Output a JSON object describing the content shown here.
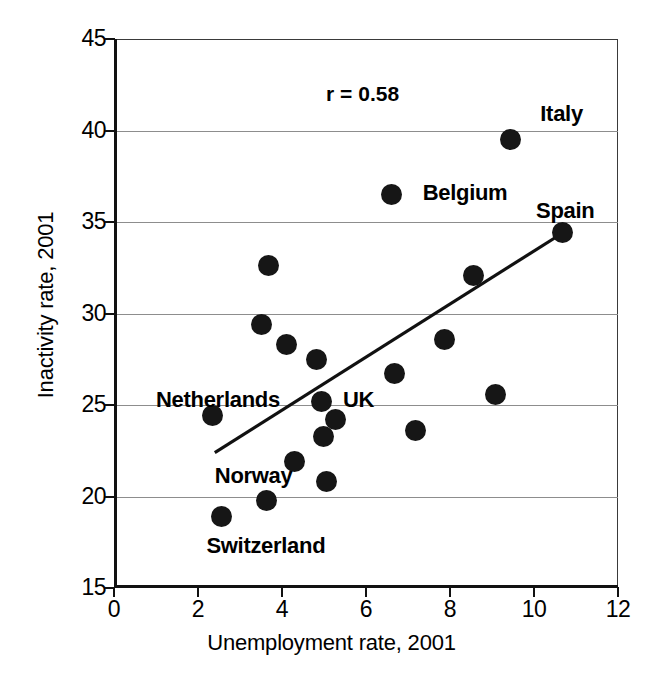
{
  "chart_data": {
    "type": "scatter",
    "title": "",
    "xlabel": "Unemployment rate, 2001",
    "ylabel": "Inactivity rate, 2001",
    "xlim": [
      0,
      12
    ],
    "ylim": [
      15,
      45
    ],
    "xticks": [
      0,
      2,
      4,
      6,
      8,
      10,
      12
    ],
    "yticks": [
      15,
      20,
      25,
      30,
      35,
      40,
      45
    ],
    "grid": "horizontal",
    "legend": "none",
    "annotations": [
      {
        "name": "correlation",
        "text": "r = 0.58",
        "x": 5.05,
        "y": 42.0
      }
    ],
    "point_labels": [
      {
        "name": "Italy",
        "text": "Italy",
        "x": 10.15,
        "y": 40.9
      },
      {
        "name": "Belgium",
        "text": "Belgium",
        "x": 7.35,
        "y": 36.6
      },
      {
        "name": "Spain",
        "text": "Spain",
        "x": 10.05,
        "y": 35.6
      },
      {
        "name": "Netherlands",
        "text": "Netherlands",
        "x": 1.0,
        "y": 25.3
      },
      {
        "name": "UK",
        "text": "UK",
        "x": 5.45,
        "y": 25.3
      },
      {
        "name": "Norway",
        "text": "Norway",
        "x": 2.4,
        "y": 21.1
      },
      {
        "name": "Switzerland",
        "text": "Switzerland",
        "x": 2.2,
        "y": 17.3
      }
    ],
    "points": [
      {
        "label": "Switzerland",
        "x": 2.55,
        "y": 18.9
      },
      {
        "label": "Netherlands",
        "x": 2.35,
        "y": 24.4
      },
      {
        "label": "",
        "x": 3.5,
        "y": 29.4
      },
      {
        "label": "Norway",
        "x": 3.62,
        "y": 19.8
      },
      {
        "label": "",
        "x": 3.68,
        "y": 32.6
      },
      {
        "label": "",
        "x": 4.1,
        "y": 28.3
      },
      {
        "label": "",
        "x": 4.3,
        "y": 21.9
      },
      {
        "label": "",
        "x": 4.82,
        "y": 27.5
      },
      {
        "label": "UK",
        "x": 4.95,
        "y": 25.2
      },
      {
        "label": "",
        "x": 4.98,
        "y": 23.3
      },
      {
        "label": "",
        "x": 5.05,
        "y": 20.8
      },
      {
        "label": "",
        "x": 5.28,
        "y": 24.2
      },
      {
        "label": "Belgium",
        "x": 6.6,
        "y": 36.5
      },
      {
        "label": "",
        "x": 6.68,
        "y": 26.7
      },
      {
        "label": "",
        "x": 7.18,
        "y": 23.6
      },
      {
        "label": "",
        "x": 7.88,
        "y": 28.6
      },
      {
        "label": "",
        "x": 8.55,
        "y": 32.1
      },
      {
        "label": "",
        "x": 9.08,
        "y": 25.6
      },
      {
        "label": "Italy",
        "x": 9.45,
        "y": 39.5
      },
      {
        "label": "Spain",
        "x": 10.68,
        "y": 34.4
      }
    ],
    "trend_line": {
      "name": "regression-line",
      "x0": 2.4,
      "y0": 22.4,
      "x1": 10.68,
      "y1": 34.4,
      "color": "#111111"
    },
    "marker": {
      "color": "#161616",
      "shape": "circle",
      "size_px": 21
    }
  },
  "artifact": {
    "text": ""
  }
}
